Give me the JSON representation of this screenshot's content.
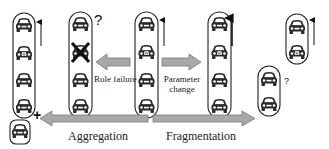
{
  "diagram": {
    "labels": {
      "role_failure": "Role failure",
      "parameter_change_line1": "Parameter",
      "parameter_change_line2": "change",
      "aggregation": "Aggregation",
      "fragmentation": "Fragmentation",
      "unknown_mark_1": "?",
      "unknown_mark_2": "?",
      "plus_mark": "+"
    },
    "colors": {
      "arrow_fill": "#a8a8a8",
      "arrow_stroke": "#7a7a7a",
      "outline": "#222222",
      "car": "#2a2a2a"
    },
    "platoons": [
      {
        "id": "aggregated",
        "cars": 4,
        "direction_arrow": true,
        "extra_car_joining": true
      },
      {
        "id": "role-failure",
        "cars": 4,
        "failed_car_index": 1,
        "question_mark": true
      },
      {
        "id": "original",
        "cars": 4,
        "direction_arrow": true
      },
      {
        "id": "parameter-changed",
        "cars": 4,
        "direction_arrow": true
      },
      {
        "id": "fragment-lower",
        "cars": 2,
        "question_mark": true
      },
      {
        "id": "fragment-upper",
        "cars": 2,
        "direction_arrow": true
      }
    ]
  }
}
